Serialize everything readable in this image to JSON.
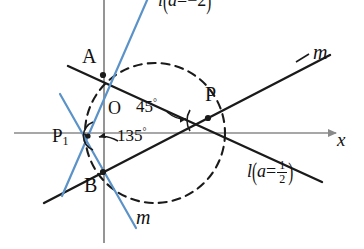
{
  "diagram": {
    "axes": {
      "x_label": "x",
      "origin_label": "O",
      "x_axis_color": "#8a8a8a",
      "y_axis_color": "#8a8a8a"
    },
    "points": [
      {
        "id": "A",
        "label": "A",
        "x": 103,
        "y": 75
      },
      {
        "id": "B",
        "label": "B",
        "x": 103,
        "y": 172
      },
      {
        "id": "P",
        "label": "P",
        "x": 208,
        "y": 118
      },
      {
        "id": "P1",
        "label": "P",
        "sub": "1",
        "x": 88,
        "y": 136
      }
    ],
    "angles": [
      {
        "id": "angle-45",
        "value": "45",
        "degree_symbol": "°",
        "at_point": "P"
      },
      {
        "id": "angle-135",
        "value": "135",
        "degree_symbol": "°",
        "at_point": "P1"
      }
    ],
    "line_labels": {
      "m_top": "m",
      "m_bottom": "m"
    },
    "equations": {
      "l_top": {
        "line": "l",
        "open": "(",
        "var": "a",
        "eq": "=",
        "value": "−2",
        "close": ")"
      },
      "l_bottom": {
        "line": "l",
        "open": "(",
        "var": "a",
        "eq": "=",
        "num": "1",
        "den": "2",
        "close": ")"
      }
    },
    "colors": {
      "black": "#1a1a1a",
      "blue": "#5b93c9",
      "axis_gray": "#8a8a8a",
      "background": "#ffffff"
    },
    "circle": {
      "cx": 155,
      "cy": 133,
      "r": 70,
      "style": "dashed"
    }
  }
}
